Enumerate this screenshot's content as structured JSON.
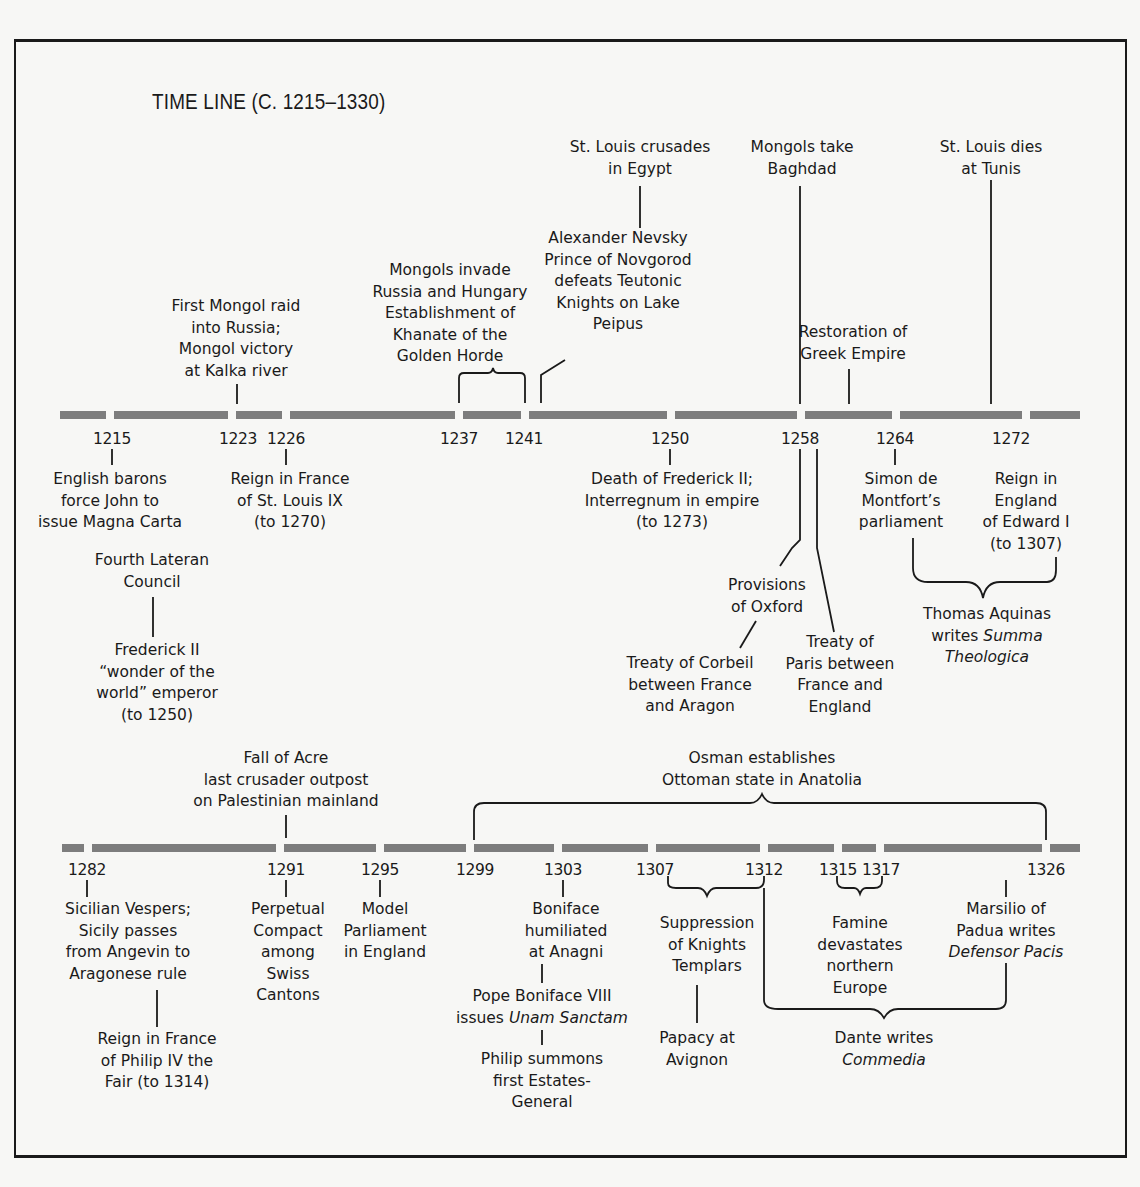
{
  "title": "TIME LINE (C. 1215–1330)",
  "colors": {
    "background": "#f7f7f5",
    "ink": "#1a1a1a",
    "bar": "#7d7d7d"
  },
  "chart_data": {
    "type": "timeline",
    "title": "TIME LINE (C. 1215–1330)",
    "range": [
      1215,
      1330
    ],
    "rows": [
      {
        "years": [
          1215,
          1223,
          1226,
          1237,
          1241,
          1250,
          1258,
          1264,
          1272
        ],
        "events": [
          {
            "year": 1215,
            "text": "English barons force John to issue Magna Carta"
          },
          {
            "year": 1215,
            "text": "Fourth Lateran Council"
          },
          {
            "year": 1215,
            "text": "Frederick II \"wonder of the world\" emperor (to 1250)"
          },
          {
            "year": 1223,
            "text": "First Mongol raid into Russia; Mongol victory at Kalka river"
          },
          {
            "year": 1226,
            "text": "Reign in France of St. Louis IX (to 1270)"
          },
          {
            "start": 1237,
            "end": 1241,
            "text": "Mongols invade Russia and Hungary Establishment of Khanate of the Golden Horde"
          },
          {
            "year": 1242,
            "text": "Alexander Nevsky Prince of Novgorod defeats Teutonic Knights on Lake Peipus"
          },
          {
            "year": 1248,
            "text": "St. Louis crusades in Egypt"
          },
          {
            "year": 1250,
            "text": "Death of Frederick II; Interregnum in empire (to 1273)"
          },
          {
            "year": 1258,
            "text": "Mongols take Baghdad"
          },
          {
            "year": 1258,
            "text": "Provisions of Oxford"
          },
          {
            "year": 1258,
            "text": "Treaty of Corbeil between France and Aragon"
          },
          {
            "year": 1259,
            "text": "Treaty of Paris between France and England"
          },
          {
            "year": 1261,
            "text": "Restoration of Greek Empire"
          },
          {
            "year": 1264,
            "text": "Simon de Montfort's parliament"
          },
          {
            "start": 1264,
            "end": 1274,
            "text": "Thomas Aquinas writes Summa Theologica"
          },
          {
            "year": 1270,
            "text": "St. Louis dies at Tunis"
          },
          {
            "year": 1272,
            "text": "Reign in England of Edward I (to 1307)"
          }
        ]
      },
      {
        "years": [
          1282,
          1291,
          1295,
          1299,
          1303,
          1307,
          1312,
          1315,
          1317,
          1326
        ],
        "events": [
          {
            "year": 1282,
            "text": "Sicilian Vespers; Sicily passes from Angevin to Aragonese rule"
          },
          {
            "year": 1285,
            "text": "Reign in France of Philip IV the Fair (to 1314)"
          },
          {
            "year": 1291,
            "text": "Fall of Acre last crusader outpost on Palestinian mainland"
          },
          {
            "year": 1291,
            "text": "Perpetual Compact among Swiss Cantons"
          },
          {
            "year": 1295,
            "text": "Model Parliament in England"
          },
          {
            "start": 1299,
            "end": 1326,
            "text": "Osman establishes Ottoman state in Anatolia"
          },
          {
            "year": 1303,
            "text": "Boniface humiliated at Anagni"
          },
          {
            "year": 1302,
            "text": "Pope Boniface VIII issues Unam Sanctam"
          },
          {
            "year": 1302,
            "text": "Philip summons first Estates-General"
          },
          {
            "start": 1307,
            "end": 1312,
            "text": "Suppression of Knights Templars"
          },
          {
            "year": 1309,
            "text": "Papacy at Avignon"
          },
          {
            "start": 1315,
            "end": 1317,
            "text": "Famine devastates northern Europe"
          },
          {
            "start": 1312,
            "end": 1324,
            "text": "Dante writes Commedia"
          },
          {
            "year": 1324,
            "text": "Marsilio of Padua writes Defensor Pacis"
          }
        ]
      }
    ]
  },
  "bars": {
    "row1": {
      "y": 411,
      "segments": [
        [
          60,
          106
        ],
        [
          114,
          228
        ],
        [
          236,
          282
        ],
        [
          290,
          455
        ],
        [
          463,
          521
        ],
        [
          529,
          667
        ],
        [
          675,
          797
        ],
        [
          805,
          892
        ],
        [
          900,
          1022
        ],
        [
          1030,
          1080
        ]
      ]
    },
    "row2": {
      "y": 844,
      "segments": [
        [
          62,
          84
        ],
        [
          92,
          276
        ],
        [
          284,
          376
        ],
        [
          384,
          466
        ],
        [
          474,
          554
        ],
        [
          562,
          648
        ],
        [
          656,
          760
        ],
        [
          768,
          834
        ],
        [
          842,
          876
        ],
        [
          884,
          1042
        ],
        [
          1050,
          1080
        ]
      ]
    }
  },
  "years": [
    {
      "id": "y1215",
      "text": "1215",
      "x": 112,
      "y": 430
    },
    {
      "id": "y1223",
      "text": "1223",
      "x": 238,
      "y": 430
    },
    {
      "id": "y1226",
      "text": "1226",
      "x": 286,
      "y": 430
    },
    {
      "id": "y1237",
      "text": "1237",
      "x": 459,
      "y": 430
    },
    {
      "id": "y1241",
      "text": "1241",
      "x": 524,
      "y": 430
    },
    {
      "id": "y1250",
      "text": "1250",
      "x": 670,
      "y": 430
    },
    {
      "id": "y1258",
      "text": "1258",
      "x": 800,
      "y": 430
    },
    {
      "id": "y1264",
      "text": "1264",
      "x": 895,
      "y": 430
    },
    {
      "id": "y1272",
      "text": "1272",
      "x": 1011,
      "y": 430
    },
    {
      "id": "y1282",
      "text": "1282",
      "x": 87,
      "y": 861
    },
    {
      "id": "y1291",
      "text": "1291",
      "x": 286,
      "y": 861
    },
    {
      "id": "y1295",
      "text": "1295",
      "x": 380,
      "y": 861
    },
    {
      "id": "y1299",
      "text": "1299",
      "x": 475,
      "y": 861
    },
    {
      "id": "y1303",
      "text": "1303",
      "x": 563,
      "y": 861
    },
    {
      "id": "y1307",
      "text": "1307",
      "x": 655,
      "y": 861
    },
    {
      "id": "y1312",
      "text": "1312",
      "x": 764,
      "y": 861
    },
    {
      "id": "y1315",
      "text": "1315",
      "x": 838,
      "y": 861
    },
    {
      "id": "y1317",
      "text": "1317",
      "x": 881,
      "y": 861
    },
    {
      "id": "y1326",
      "text": "1326",
      "x": 1046,
      "y": 861
    }
  ],
  "labels": [
    {
      "id": "first-mongol-raid",
      "x": 236,
      "y": 296,
      "lines": [
        "First Mongol raid",
        "into Russia;",
        "Mongol victory",
        "at Kalka river"
      ]
    },
    {
      "id": "mongols-invade-russia",
      "x": 450,
      "y": 260,
      "lines": [
        "Mongols invade",
        "Russia and Hungary",
        "Establishment of",
        "Khanate of the",
        "Golden Horde"
      ]
    },
    {
      "id": "st-louis-crusades",
      "x": 640,
      "y": 137,
      "lines": [
        "St. Louis crusades",
        "in Egypt"
      ]
    },
    {
      "id": "alexander-nevsky",
      "x": 618,
      "y": 228,
      "lines": [
        "Alexander Nevsky",
        "Prince of Novgorod",
        "defeats Teutonic",
        "Knights on Lake",
        "Peipus"
      ]
    },
    {
      "id": "mongols-take-baghdad",
      "x": 802,
      "y": 137,
      "lines": [
        "Mongols take",
        "Baghdad"
      ]
    },
    {
      "id": "restoration-greek-empire",
      "x": 853,
      "y": 322,
      "lines": [
        "Restoration of",
        "Greek Empire"
      ]
    },
    {
      "id": "st-louis-dies",
      "x": 991,
      "y": 137,
      "lines": [
        "St. Louis dies",
        "at Tunis"
      ]
    },
    {
      "id": "english-barons",
      "x": 110,
      "y": 469,
      "lines": [
        "English barons",
        "force John to",
        "issue Magna Carta"
      ]
    },
    {
      "id": "reign-st-louis",
      "x": 290,
      "y": 469,
      "lines": [
        "Reign in France",
        "of St. Louis IX",
        "(to 1270)"
      ]
    },
    {
      "id": "fourth-lateran",
      "x": 152,
      "y": 550,
      "lines": [
        "Fourth Lateran",
        "Council"
      ]
    },
    {
      "id": "frederick-ii",
      "x": 157,
      "y": 640,
      "lines": [
        "Frederick II",
        "“wonder of the",
        "world” emperor",
        "(to 1250)"
      ]
    },
    {
      "id": "death-frederick",
      "x": 672,
      "y": 469,
      "lines": [
        "Death of Frederick II;",
        "Interregnum in empire",
        "(to 1273)"
      ]
    },
    {
      "id": "simon-de-montfort",
      "x": 901,
      "y": 469,
      "lines": [
        "Simon de",
        "Montfort’s",
        "parliament"
      ]
    },
    {
      "id": "reign-edward",
      "x": 1026,
      "y": 469,
      "lines": [
        "Reign in",
        "England",
        "of Edward I",
        "(to 1307)"
      ]
    },
    {
      "id": "provisions-oxford",
      "x": 767,
      "y": 575,
      "lines": [
        "Provisions",
        "of Oxford"
      ]
    },
    {
      "id": "treaty-corbeil",
      "x": 690,
      "y": 653,
      "lines": [
        "Treaty of Corbeil",
        "between France",
        "and Aragon"
      ]
    },
    {
      "id": "treaty-paris",
      "x": 840,
      "y": 632,
      "lines": [
        "Treaty of",
        "Paris between",
        "France and",
        "England"
      ]
    },
    {
      "id": "thomas-aquinas",
      "x": 987,
      "y": 604,
      "lines": [
        "Thomas Aquinas",
        "writes <em>Summa</em>",
        "<em>Theologica</em>"
      ]
    },
    {
      "id": "fall-of-acre",
      "x": 286,
      "y": 748,
      "lines": [
        "Fall of Acre",
        "last crusader outpost",
        "on Palestinian mainland"
      ]
    },
    {
      "id": "osman",
      "x": 762,
      "y": 748,
      "lines": [
        "Osman establishes",
        "Ottoman state in Anatolia"
      ]
    },
    {
      "id": "sicilian-vespers",
      "x": 128,
      "y": 899,
      "lines": [
        "Sicilian Vespers;",
        "Sicily passes",
        "from Angevin to",
        "Aragonese rule"
      ]
    },
    {
      "id": "philip-iv",
      "x": 157,
      "y": 1029,
      "lines": [
        "Reign in France",
        "of Philip IV the",
        "Fair (to 1314)"
      ]
    },
    {
      "id": "perpetual-compact",
      "x": 288,
      "y": 899,
      "lines": [
        "Perpetual",
        "Compact",
        "among",
        "Swiss",
        "Cantons"
      ]
    },
    {
      "id": "model-parliament",
      "x": 385,
      "y": 899,
      "lines": [
        "Model",
        "Parliament",
        "in England"
      ]
    },
    {
      "id": "boniface-anagni",
      "x": 566,
      "y": 899,
      "lines": [
        "Boniface",
        "humiliated",
        "at Anagni"
      ]
    },
    {
      "id": "unam-sanctam",
      "x": 542,
      "y": 986,
      "lines": [
        "Pope Boniface VIII",
        "issues <em>Unam Sanctam</em>"
      ]
    },
    {
      "id": "estates-general",
      "x": 542,
      "y": 1049,
      "lines": [
        "Philip summons",
        "first Estates-",
        "General"
      ]
    },
    {
      "id": "knights-templars",
      "x": 707,
      "y": 913,
      "lines": [
        "Suppression",
        "of  Knights",
        "Templars"
      ]
    },
    {
      "id": "papacy-avignon",
      "x": 697,
      "y": 1028,
      "lines": [
        "Papacy at",
        "Avignon"
      ]
    },
    {
      "id": "famine",
      "x": 860,
      "y": 913,
      "lines": [
        "Famine",
        "devastates",
        "northern",
        "Europe"
      ]
    },
    {
      "id": "marsilio",
      "x": 1006,
      "y": 899,
      "lines": [
        "Marsilio of",
        "Padua writes",
        "<em>Defensor Pacis</em>"
      ]
    },
    {
      "id": "dante",
      "x": 884,
      "y": 1028,
      "lines": [
        "Dante writes",
        "<em>Commedia</em>"
      ]
    }
  ],
  "connectors": {
    "lines": [
      [
        237,
        384,
        237,
        404
      ],
      [
        640,
        186,
        640,
        228
      ],
      [
        800,
        186,
        800,
        404
      ],
      [
        849,
        369,
        849,
        404
      ],
      [
        991,
        180,
        991,
        404
      ],
      [
        112,
        449,
        112,
        465
      ],
      [
        286,
        449,
        286,
        465
      ],
      [
        670,
        449,
        670,
        465
      ],
      [
        895,
        449,
        895,
        465
      ],
      [
        153,
        597,
        153,
        637
      ],
      [
        286,
        815,
        286,
        838
      ],
      [
        87,
        880,
        87,
        897
      ],
      [
        286,
        880,
        286,
        897
      ],
      [
        380,
        880,
        380,
        897
      ],
      [
        563,
        880,
        563,
        897
      ],
      [
        157,
        990,
        157,
        1027
      ],
      [
        542,
        964,
        542,
        983
      ],
      [
        542,
        1030,
        542,
        1045
      ],
      [
        697,
        985,
        697,
        1023
      ],
      [
        1006,
        880,
        1006,
        897
      ]
    ],
    "polylines": [
      "541,403 541,375 565,360",
      "800,449 800,540 792,548 780,566",
      "817,449 817,548 834,632",
      "756,621 740,648"
    ],
    "paths": [
      "M459,403 L459,378 Q459,373 464,373 L488,373 Q492,373 493,368 Q494,373 498,373 L520,373 Q525,373 525,378 L525,403",
      "M913,538 L913,568 Q913,582 928,582 L966,582 Q980,582 983,598 Q986,582 1000,582 L1047,582 Q1056,582 1056,570 L1056,557",
      "M474,840 L474,812 Q474,803 484,803 L750,803 Q758,803 762,794 Q766,803 774,803 L1036,803 Q1046,803 1046,812 L1046,840",
      "M668,876 L668,883 Q668,888 676,888 L698,888 Q704,888 707,896 Q710,888 716,888 L756,888 Q764,888 764,880 L764,876",
      "M764,888 L764,1000 Q764,1009 778,1009 L870,1009 Q879,1009 884,1018 Q889,1009 898,1009 L996,1009 Q1006,1009 1006,1000 L1006,963",
      "M837,876 L837,881 Q837,888 845,888 L854,888 Q858,888 860,894 Q862,888 866,888 L874,888 Q882,888 882,881 L882,876"
    ]
  }
}
